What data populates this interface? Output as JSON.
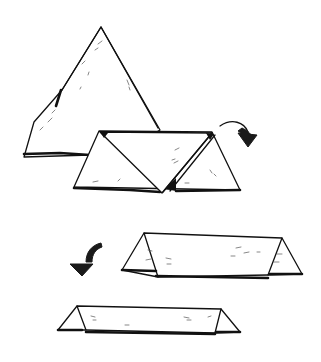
{
  "illustration": {
    "type": "folding-instructions",
    "steps": [
      {
        "id": 1,
        "description": "large triangle"
      },
      {
        "id": 2,
        "description": "triangle folded into trapezoid with center inverted triangle"
      },
      {
        "id": 3,
        "description": "long prism/tent shape"
      },
      {
        "id": 4,
        "description": "longer flat prism/tent shape"
      }
    ],
    "arrows": [
      {
        "id": "arrow-1",
        "direction": "curved-down-right"
      },
      {
        "id": "arrow-2",
        "direction": "curved-down-left"
      }
    ],
    "colors": {
      "ink": "#111111",
      "background": "#ffffff"
    }
  }
}
